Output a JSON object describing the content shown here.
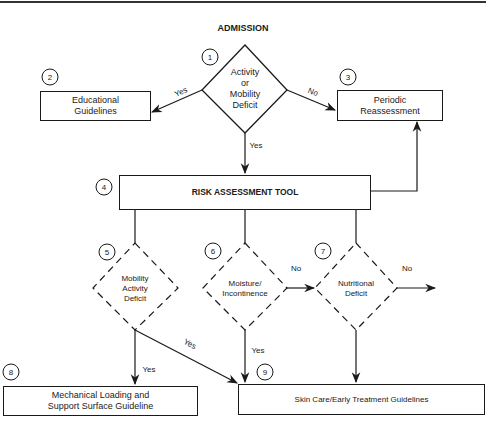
{
  "title": "ADMISSION",
  "nodes": {
    "n1": {
      "number": "1",
      "label_lines": [
        "Activity",
        "or",
        "Mobility",
        "Deficit"
      ],
      "shape": "diamond",
      "style": "solid"
    },
    "n2": {
      "number": "2",
      "label_lines": [
        "Educational",
        "Guidelines"
      ],
      "shape": "rectangle"
    },
    "n3": {
      "number": "3",
      "label_lines": [
        "Periodic",
        "Reassessment"
      ],
      "shape": "rectangle"
    },
    "n4": {
      "number": "4",
      "label": "RISK ASSESSMENT TOOL",
      "shape": "rectangle"
    },
    "n5": {
      "number": "5",
      "label_lines": [
        "Mobility",
        "Activity",
        "Deficit"
      ],
      "shape": "diamond",
      "style": "dashed"
    },
    "n6": {
      "number": "6",
      "label_lines": [
        "Moisture/",
        "Incontinence"
      ],
      "shape": "diamond",
      "style": "dashed"
    },
    "n7": {
      "number": "7",
      "label_lines": [
        "Nutritional",
        "Deficit"
      ],
      "shape": "diamond",
      "style": "dashed"
    },
    "n8": {
      "number": "8",
      "label_lines": [
        "Mechanical Loading and",
        "Support Surface Guideline"
      ],
      "shape": "rectangle"
    },
    "n9": {
      "number": "9",
      "label": "Skin Care/Early Treatment Guidelines",
      "shape": "rectangle"
    }
  },
  "edges": {
    "e1_2": {
      "from": "1",
      "to": "2",
      "label": "Yes"
    },
    "e1_3": {
      "from": "1",
      "to": "3",
      "label": "No"
    },
    "e1_4": {
      "from": "1",
      "to": "4",
      "label": "Yes"
    },
    "e4_3": {
      "from": "4",
      "to": "3",
      "label": ""
    },
    "e5_8": {
      "from": "5",
      "to": "8",
      "label": "Yes"
    },
    "e5_9": {
      "from": "5",
      "to": "9",
      "label": "Yes"
    },
    "e6_7": {
      "from": "6",
      "to": "7",
      "label": "No"
    },
    "e6_9": {
      "from": "6",
      "to": "9",
      "label": "Yes"
    },
    "e7_out": {
      "from": "7",
      "to": "",
      "label": "No"
    },
    "e7_9": {
      "from": "7",
      "to": "9",
      "label": ""
    }
  },
  "colors": {
    "stroke": "#1a1a1a",
    "background": "#ffffff"
  }
}
